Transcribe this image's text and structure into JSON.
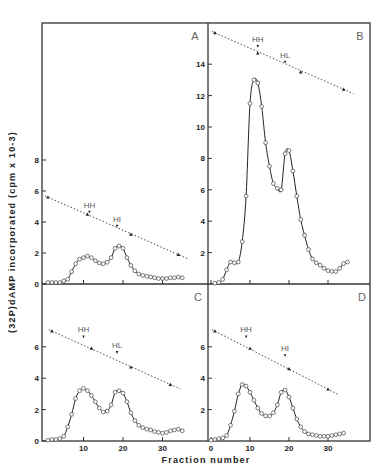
{
  "figure": {
    "x_axis_title": "Fraction number",
    "y_axis_title": "(32P)dAMP incorporated (cpm x 10-3)"
  },
  "chart_data": [
    {
      "type": "line",
      "panel": "A",
      "xlabel": "Fraction number",
      "ylabel": "(32P)dAMP incorporated (cpm x 10-3)",
      "xlim": [
        0,
        41
      ],
      "ylim": [
        0,
        16
      ],
      "y_ticks": [
        0,
        2,
        4,
        6,
        8
      ],
      "x_ticks": [
        10,
        20,
        30
      ],
      "series": [
        {
          "name": "activity",
          "marker": "open-circle",
          "x": [
            1,
            2,
            3,
            4,
            5,
            6,
            7,
            8,
            9,
            10,
            11,
            12,
            13,
            14,
            15,
            16,
            17,
            18,
            19,
            20,
            21,
            22,
            23,
            24,
            25,
            26,
            27,
            28,
            29,
            30,
            31,
            32,
            33,
            34,
            35
          ],
          "y": [
            0.1,
            0.1,
            0.1,
            0.1,
            0.2,
            0.3,
            0.8,
            1.3,
            1.6,
            1.7,
            1.8,
            1.7,
            1.5,
            1.35,
            1.3,
            1.4,
            1.7,
            2.3,
            2.45,
            2.3,
            1.7,
            1.2,
            0.85,
            0.65,
            0.55,
            0.5,
            0.45,
            0.4,
            0.35,
            0.35,
            0.35,
            0.4,
            0.4,
            0.45,
            0.4
          ]
        },
        {
          "name": "density gradient",
          "marker": "filled-triangle",
          "style": "dotted",
          "x": [
            1,
            11,
            22,
            34
          ],
          "y": [
            5.6,
            4.5,
            3.2,
            1.9
          ]
        }
      ],
      "annotations": [
        {
          "text": "HH",
          "x": 11.5,
          "y": 4.6
        },
        {
          "text": "HI",
          "x": 18.5,
          "y": 3.7
        }
      ]
    },
    {
      "type": "line",
      "panel": "B",
      "xlabel": "Fraction number",
      "xlim": [
        0,
        41
      ],
      "ylim": [
        0,
        16
      ],
      "y_ticks": [
        2,
        4,
        6,
        8,
        10,
        12,
        14
      ],
      "x_ticks": [
        0,
        10,
        20,
        30
      ],
      "series": [
        {
          "name": "activity",
          "marker": "open-circle",
          "x": [
            1,
            2,
            3,
            4,
            5,
            6,
            7,
            8,
            9,
            10,
            11,
            12,
            13,
            14,
            15,
            16,
            17,
            18,
            19,
            20,
            21,
            22,
            23,
            24,
            25,
            26,
            27,
            28,
            29,
            30,
            31,
            32,
            33,
            34,
            35
          ],
          "y": [
            0.05,
            0.1,
            0.3,
            0.9,
            1.4,
            1.35,
            1.4,
            2.7,
            5.6,
            11.5,
            13.0,
            12.8,
            11.3,
            9.0,
            7.5,
            6.4,
            6.1,
            6.0,
            8.3,
            8.5,
            7.2,
            5.6,
            4.1,
            3.1,
            2.2,
            1.6,
            1.35,
            1.2,
            1.0,
            0.85,
            0.8,
            0.8,
            1.0,
            1.3,
            1.4
          ]
        },
        {
          "name": "density gradient",
          "marker": "filled-triangle",
          "style": "dotted",
          "x": [
            1,
            12,
            23,
            34
          ],
          "y": [
            16.0,
            14.7,
            13.5,
            12.4
          ]
        }
      ],
      "annotations": [
        {
          "text": "HH",
          "x": 12,
          "y": 15.1
        },
        {
          "text": "HL",
          "x": 19,
          "y": 14.1
        }
      ]
    },
    {
      "type": "line",
      "panel": "C",
      "xlabel": "Fraction number",
      "xlim": [
        0,
        41
      ],
      "ylim": [
        0,
        9.5
      ],
      "y_ticks": [
        0,
        2,
        4,
        6
      ],
      "x_ticks": [
        10,
        20,
        30
      ],
      "series": [
        {
          "name": "activity",
          "marker": "open-circle",
          "x": [
            1,
            2,
            3,
            4,
            5,
            6,
            7,
            8,
            9,
            10,
            11,
            12,
            13,
            14,
            15,
            16,
            17,
            18,
            19,
            20,
            21,
            22,
            23,
            24,
            25,
            26,
            27,
            28,
            29,
            30,
            31,
            32,
            33,
            34,
            35
          ],
          "y": [
            0.05,
            0.1,
            0.1,
            0.15,
            0.3,
            0.9,
            1.7,
            2.7,
            3.2,
            3.35,
            3.2,
            2.9,
            2.5,
            2.1,
            1.85,
            1.9,
            2.3,
            3.1,
            3.2,
            3.05,
            2.5,
            1.8,
            1.3,
            1.0,
            0.85,
            0.75,
            0.7,
            0.6,
            0.55,
            0.5,
            0.55,
            0.65,
            0.7,
            0.75,
            0.65
          ]
        },
        {
          "name": "density gradient",
          "marker": "filled-triangle",
          "style": "dotted",
          "x": [
            2,
            12,
            22,
            32
          ],
          "y": [
            7.0,
            5.9,
            4.7,
            3.6
          ]
        }
      ],
      "annotations": [
        {
          "text": "HH",
          "x": 10,
          "y": 6.6
        },
        {
          "text": "HL",
          "x": 18.5,
          "y": 5.6
        }
      ]
    },
    {
      "type": "line",
      "panel": "D",
      "xlabel": "Fraction number",
      "xlim": [
        0,
        41
      ],
      "ylim": [
        0,
        9.5
      ],
      "y_ticks": [
        2,
        4,
        6
      ],
      "x_ticks": [
        0,
        10,
        20,
        30
      ],
      "series": [
        {
          "name": "activity",
          "marker": "open-circle",
          "x": [
            0,
            1,
            2,
            3,
            4,
            5,
            6,
            7,
            8,
            9,
            10,
            11,
            12,
            13,
            14,
            15,
            16,
            17,
            18,
            19,
            20,
            21,
            22,
            23,
            24,
            25,
            26,
            27,
            28,
            29,
            30,
            31,
            32,
            33,
            34
          ],
          "y": [
            0.05,
            0.1,
            0.15,
            0.2,
            0.35,
            1.0,
            1.9,
            3.0,
            3.6,
            3.5,
            3.1,
            2.6,
            2.1,
            1.75,
            1.6,
            1.6,
            1.8,
            2.3,
            3.1,
            3.25,
            2.8,
            2.1,
            1.4,
            0.9,
            0.6,
            0.45,
            0.4,
            0.35,
            0.3,
            0.3,
            0.3,
            0.35,
            0.4,
            0.45,
            0.5
          ]
        },
        {
          "name": "density gradient",
          "marker": "filled-triangle",
          "style": "dotted",
          "x": [
            1,
            10,
            20,
            30
          ],
          "y": [
            7.0,
            5.9,
            4.6,
            3.3
          ]
        }
      ],
      "annotations": [
        {
          "text": "HH",
          "x": 9,
          "y": 6.6
        },
        {
          "text": "HI",
          "x": 19,
          "y": 5.4
        }
      ]
    }
  ]
}
